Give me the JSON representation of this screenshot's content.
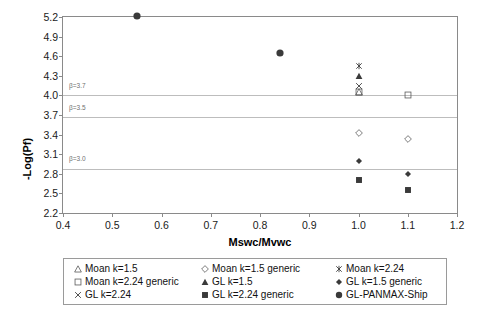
{
  "chart_data": {
    "type": "scatter",
    "title": "",
    "xlabel": "Mswc/Mvwc",
    "ylabel": "-Log(Pf)",
    "xlim": [
      0.4,
      1.2
    ],
    "ylim": [
      2.2,
      5.2
    ],
    "xticks": [
      "0.4",
      "0.5",
      "0.6",
      "0.7",
      "0.8",
      "0.9",
      "1.0",
      "1.1",
      "1.2"
    ],
    "yticks": [
      "2.2",
      "2.5",
      "2.8",
      "3.1",
      "3.4",
      "3.7",
      "4.0",
      "4.3",
      "4.6",
      "4.9",
      "5.2"
    ],
    "grid": "horizontal-reference-lines-only",
    "legend_position": "bottom",
    "reference_lines": [
      {
        "label": "β=3.7",
        "y": 4.0
      },
      {
        "label": "β=3.5",
        "y": 3.67
      },
      {
        "label": "β=3.0",
        "y": 2.87
      }
    ],
    "series": [
      {
        "name": "Moan k=1.5",
        "marker": "open-triangle",
        "points": [
          {
            "x": 1.0,
            "y": 4.05
          }
        ]
      },
      {
        "name": "Moan k=1.5 generic",
        "marker": "open-diamond",
        "points": [
          {
            "x": 1.0,
            "y": 3.42
          },
          {
            "x": 1.1,
            "y": 3.33
          }
        ]
      },
      {
        "name": "Moan k=2.24",
        "marker": "asterisk",
        "points": [
          {
            "x": 1.0,
            "y": 4.45
          }
        ]
      },
      {
        "name": "Moan k=2.24 generic",
        "marker": "open-square",
        "points": [
          {
            "x": 1.0,
            "y": 4.05
          },
          {
            "x": 1.1,
            "y": 4.0
          }
        ]
      },
      {
        "name": "GL k=1.5",
        "marker": "filled-triangle",
        "points": [
          {
            "x": 1.0,
            "y": 4.3
          }
        ]
      },
      {
        "name": "GL k=1.5 generic",
        "marker": "filled-diamond",
        "points": [
          {
            "x": 1.0,
            "y": 3.0
          },
          {
            "x": 1.1,
            "y": 2.8
          }
        ]
      },
      {
        "name": "GL k=2.24",
        "marker": "cross",
        "points": [
          {
            "x": 1.0,
            "y": 4.15
          }
        ]
      },
      {
        "name": "GL k=2.24 generic",
        "marker": "filled-square",
        "points": [
          {
            "x": 1.0,
            "y": 2.7
          },
          {
            "x": 1.1,
            "y": 2.55
          }
        ]
      },
      {
        "name": "GL-PANMAX-Ship",
        "marker": "filled-circle",
        "points": [
          {
            "x": 0.55,
            "y": 5.22
          },
          {
            "x": 0.84,
            "y": 4.65
          }
        ]
      }
    ]
  },
  "legend": {
    "rows": [
      [
        {
          "marker": "open-triangle",
          "label": "Moan k=1.5"
        },
        {
          "marker": "open-diamond",
          "label": "Moan k=1.5 generic"
        },
        {
          "marker": "asterisk",
          "label": "Moan k=2.24"
        }
      ],
      [
        {
          "marker": "open-square",
          "label": "Moan k=2.24 generic"
        },
        {
          "marker": "filled-triangle",
          "label": "GL k=1.5"
        },
        {
          "marker": "filled-diamond",
          "label": "GL k=1.5 generic"
        }
      ],
      [
        {
          "marker": "cross",
          "label": "GL k=2.24"
        },
        {
          "marker": "filled-square",
          "label": "GL k=2.24 generic"
        },
        {
          "marker": "filled-circle",
          "label": "GL-PANMAX-Ship"
        }
      ]
    ]
  }
}
